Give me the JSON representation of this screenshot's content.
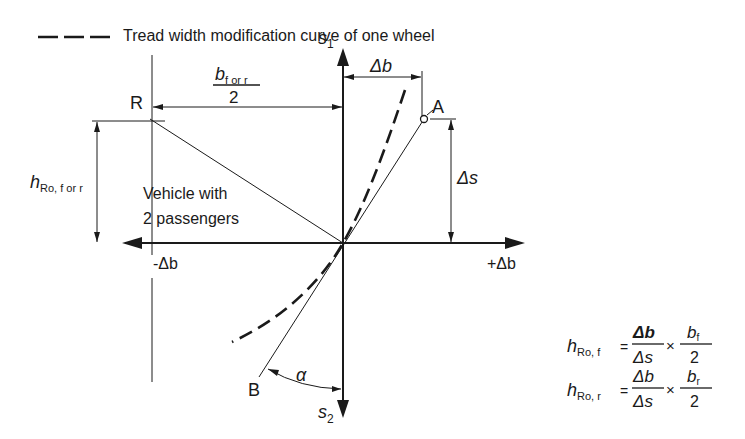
{
  "legend": {
    "line_style": "dashed",
    "label": "Tread width modification curve of one wheel"
  },
  "axes": {
    "vertical_up": {
      "label": "s",
      "subscript": "1"
    },
    "vertical_down": {
      "label": "s",
      "subscript": "2"
    },
    "horizontal_left": {
      "label": "-Δb"
    },
    "horizontal_right": {
      "label": "+Δb"
    }
  },
  "points": {
    "R": "R",
    "A": "A",
    "B": "B"
  },
  "dimensions": {
    "half_track": {
      "numerator": "b",
      "numerator_sub": "f or r",
      "denominator": "2"
    },
    "delta_b": "Δb",
    "delta_s": "Δs",
    "roll_center_height": {
      "label": "h",
      "subscript": "Ro, f or r"
    },
    "angle": "α"
  },
  "annotation": {
    "line1": "Vehicle with",
    "line2": "2 passengers"
  },
  "formulas": [
    {
      "lhs": "h",
      "lhs_sub": "Ro, f",
      "eq": "=",
      "num1": "Δb",
      "den1": "Δs",
      "times": "×",
      "num2": "b",
      "num2_sub": "f",
      "den2": "2"
    },
    {
      "lhs": "h",
      "lhs_sub": "Ro, r",
      "eq": "=",
      "num1": "Δb",
      "den1": "Δs",
      "times": "×",
      "num2": "b",
      "num2_sub": "r",
      "den2": "2"
    }
  ]
}
